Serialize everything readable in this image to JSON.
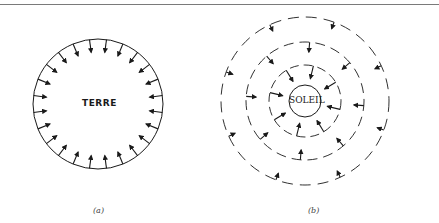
{
  "figure": {
    "panels": [
      {
        "id": "a",
        "caption": "(a)",
        "center_label": "TERRE",
        "description": "Solid circle with arrows pointing radially inward from circumference",
        "circle": {
          "cx": 98,
          "cy": 104,
          "r": 65,
          "style": "solid"
        },
        "arrow_count": 24
      },
      {
        "id": "b",
        "caption": "(b)",
        "center_label": "SOLEIL",
        "description": "Small solid circle surrounded by three dashed concentric circles with inward-pointing arrows",
        "center_circle": {
          "cx": 305,
          "cy": 101,
          "r": 16,
          "style": "solid"
        },
        "dashed_circles": [
          36,
          59,
          84
        ]
      }
    ]
  },
  "colors": {
    "ink": "#1a1a1a",
    "rule": "#7a7a7a",
    "background": "#ffffff"
  }
}
